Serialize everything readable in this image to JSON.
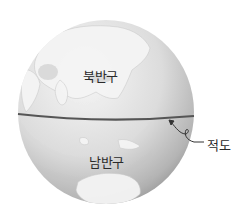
{
  "diagram": {
    "northern_hemisphere_label": "북반구",
    "southern_hemisphere_label": "남반구",
    "equator_label": "적도",
    "colors": {
      "globe_light": "#f2f2f2",
      "globe_dark": "#9a9a9a",
      "equator_line": "#555555",
      "land": "#ffffff"
    }
  }
}
